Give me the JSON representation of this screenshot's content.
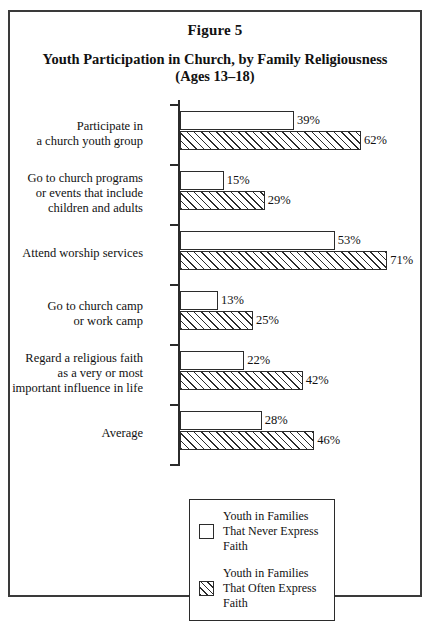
{
  "figure": {
    "number_label": "Figure 5",
    "title": "Youth Participation in Church, by Family Religiousness (Ages 13–18)"
  },
  "legend": {
    "entries": [
      {
        "swatch": "open-square-swatch",
        "label": "Youth in Families That Never Express Faith"
      },
      {
        "swatch": "hatched-square-swatch",
        "label": "Youth in Families That Often Express Faith"
      }
    ]
  },
  "chart_data": {
    "type": "bar",
    "orientation": "horizontal",
    "title": "Youth Participation in Church, by Family Religiousness (Ages 13–18)",
    "xlabel": "",
    "ylabel": "",
    "xlim": [
      0,
      75
    ],
    "grid": false,
    "legend_position": "bottom-center",
    "value_suffix": "%",
    "categories": [
      "Participate in a church youth group",
      "Go to church programs or events that include children and adults",
      "Attend worship services",
      "Go to church camp or work camp",
      "Regard a religious faith as a very or most important influence in life",
      "Average"
    ],
    "category_label_lines": [
      [
        "Participate in",
        "a church youth group"
      ],
      [
        "Go to church programs",
        "or events that include",
        "children and adults"
      ],
      [
        "Attend worship services"
      ],
      [
        "Go to church camp",
        "or work camp"
      ],
      [
        "Regard a religious faith",
        "as a very or most",
        "important influence in life"
      ],
      [
        "Average"
      ]
    ],
    "series": [
      {
        "name": "Youth in Families That Never Express Faith",
        "style": "open",
        "values": [
          39,
          15,
          53,
          13,
          22,
          28
        ],
        "labels": [
          "39%",
          "15%",
          "53%",
          "13%",
          "22%",
          "28%"
        ]
      },
      {
        "name": "Youth in Families That Often Express Faith",
        "style": "hatched",
        "values": [
          62,
          29,
          71,
          25,
          42,
          46
        ],
        "labels": [
          "62%",
          "29%",
          "71%",
          "25%",
          "42%",
          "46%"
        ]
      }
    ]
  }
}
